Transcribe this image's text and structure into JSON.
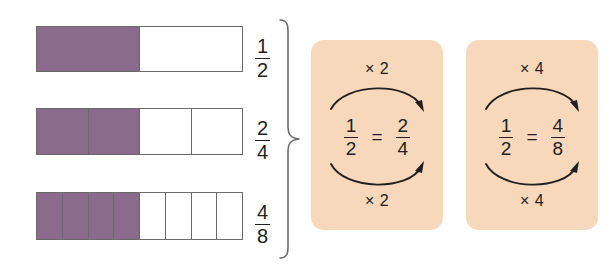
{
  "page": {
    "background_color": "#ffffff"
  },
  "palette": {
    "bar_fill": "#8a6b8c",
    "bar_empty": "#ffffff",
    "bar_stroke": "#6b6b6b",
    "card_background": "#f7d8bb",
    "ink": "#231f20"
  },
  "bars": [
    {
      "name": "one-half",
      "total_parts": 2,
      "shaded_parts": 1,
      "label": {
        "numerator": "1",
        "denominator": "2"
      }
    },
    {
      "name": "two-fourths",
      "total_parts": 4,
      "shaded_parts": 2,
      "label": {
        "numerator": "2",
        "denominator": "4"
      }
    },
    {
      "name": "four-eighths",
      "total_parts": 8,
      "shaded_parts": 4,
      "label": {
        "numerator": "4",
        "denominator": "8"
      }
    }
  ],
  "brace": {
    "name": "grouping-brace",
    "direction": "right"
  },
  "cards": [
    {
      "name": "times-two-card",
      "top_operation": "× 2",
      "bottom_operation": "× 2",
      "left_fraction": {
        "numerator": "1",
        "denominator": "2"
      },
      "equals": "=",
      "right_fraction": {
        "numerator": "2",
        "denominator": "4"
      }
    },
    {
      "name": "times-four-card",
      "top_operation": "× 4",
      "bottom_operation": "× 4",
      "left_fraction": {
        "numerator": "1",
        "denominator": "2"
      },
      "equals": "=",
      "right_fraction": {
        "numerator": "4",
        "denominator": "8"
      }
    }
  ]
}
